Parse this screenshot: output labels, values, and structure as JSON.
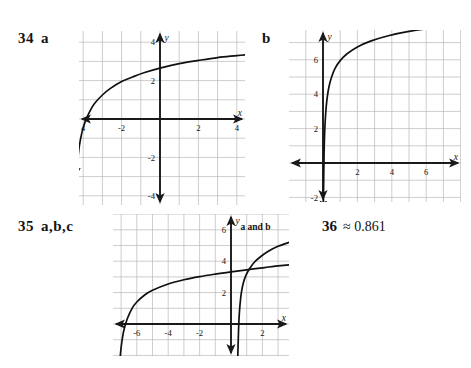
{
  "page": {
    "background": "#ffffff",
    "ink": "#141414",
    "grid_color": "#b9b9b9",
    "axis_color": "#1a1a1a",
    "curve_color": "#101010"
  },
  "items": [
    {
      "id": "item-34",
      "number": "34",
      "parts": "a",
      "label_x": 18,
      "label_y": 30
    },
    {
      "id": "item-34b",
      "number": "",
      "parts": "b",
      "label_x": 262,
      "label_y": 30
    },
    {
      "id": "item-35",
      "number": "35",
      "parts": "a,b,c",
      "label_x": 18,
      "label_y": 218
    }
  ],
  "answer_36": {
    "number": "36",
    "value": "≈ 0.861",
    "x": 322,
    "y": 218
  },
  "chart_data": [
    {
      "id": "graph-34a",
      "type": "line",
      "title": "34 a",
      "xlabel": "x",
      "ylabel": "y",
      "xlim": [
        -5,
        5
      ],
      "ylim": [
        -5,
        5
      ],
      "xticks": [
        -4,
        -2,
        2,
        4
      ],
      "xtick_labels": [
        "4",
        "-2",
        "2",
        "4"
      ],
      "yticks": [
        4,
        2,
        -2,
        -4
      ],
      "ytick_labels": [
        "4",
        "2",
        "-2",
        "-4"
      ],
      "grid": true,
      "legend": "none",
      "series": [
        {
          "name": "a",
          "description": "logarithmic curve, vertical asymptote near x = -4.4",
          "points": [
            [
              -4.35,
              -2.9
            ],
            [
              -4.3,
              -2.3
            ],
            [
              -4.25,
              -1.8
            ],
            [
              -4.2,
              -1.4
            ],
            [
              -4.1,
              -0.85
            ],
            [
              -4.0,
              -0.45
            ],
            [
              -3.9,
              -0.15
            ],
            [
              -3.8,
              0.1
            ],
            [
              -3.6,
              0.5
            ],
            [
              -3.4,
              0.82
            ],
            [
              -3.0,
              1.25
            ],
            [
              -2.6,
              1.58
            ],
            [
              -2.0,
              1.95
            ],
            [
              -1.4,
              2.2
            ],
            [
              -0.8,
              2.42
            ],
            [
              0.0,
              2.65
            ],
            [
              1.0,
              2.88
            ],
            [
              2.0,
              3.05
            ],
            [
              3.0,
              3.2
            ],
            [
              4.0,
              3.3
            ],
            [
              4.8,
              3.38
            ]
          ],
          "arrow_start": true,
          "arrow_end": true
        }
      ]
    },
    {
      "id": "graph-34b",
      "type": "line",
      "title": "b",
      "xlabel": "x",
      "ylabel": "y",
      "xlim": [
        -3,
        9
      ],
      "ylim": [
        -2.8,
        9
      ],
      "xticks": [
        -2,
        2,
        4,
        6,
        8
      ],
      "xtick_labels": [
        "-2",
        "2",
        "4",
        "6",
        "8"
      ],
      "yticks": [
        2,
        4,
        6,
        8,
        -2
      ],
      "ytick_labels": [
        "2",
        "4",
        "6",
        "8",
        "-2"
      ],
      "grid": true,
      "legend": "none",
      "series": [
        {
          "name": "b",
          "description": "logarithmic curve, vertical asymptote at x = 0",
          "points": [
            [
              0.02,
              -2.6
            ],
            [
              0.04,
              -1.0
            ],
            [
              0.06,
              0.4
            ],
            [
              0.08,
              1.3
            ],
            [
              0.12,
              2.3
            ],
            [
              0.18,
              3.2
            ],
            [
              0.25,
              3.85
            ],
            [
              0.35,
              4.45
            ],
            [
              0.5,
              5.0
            ],
            [
              0.7,
              5.5
            ],
            [
              1.0,
              5.95
            ],
            [
              1.4,
              6.35
            ],
            [
              2.0,
              6.75
            ],
            [
              2.8,
              7.1
            ],
            [
              3.8,
              7.4
            ],
            [
              5.0,
              7.65
            ],
            [
              6.4,
              7.85
            ],
            [
              8.0,
              8.0
            ],
            [
              8.9,
              8.05
            ]
          ],
          "arrow_start": true,
          "arrow_end": true
        }
      ]
    },
    {
      "id": "graph-35",
      "type": "line",
      "title": "35 a,b,c",
      "xlabel": "x",
      "ylabel": "y",
      "xlim": [
        -8,
        6
      ],
      "ylim": [
        -2.8,
        7.2
      ],
      "xticks": [
        -6,
        -4,
        -2,
        2,
        4
      ],
      "xtick_labels": [
        "-6",
        "-4",
        "-2",
        "2",
        "4"
      ],
      "yticks": [
        6,
        4,
        2,
        -2
      ],
      "ytick_labels": [
        "6",
        "4",
        "2",
        "-2"
      ],
      "grid": true,
      "legend": "inline",
      "annotations": [
        {
          "text": "a and b",
          "x": 0.6,
          "y": 6.0
        },
        {
          "text": "c",
          "x": 4.0,
          "y": 2.6
        }
      ],
      "series": [
        {
          "name": "a and b",
          "description": "steep logarithmic curve, vertical asymptote near x = 0.35, passes intersection near (1.2, 3.3)",
          "points": [
            [
              0.42,
              -2.6
            ],
            [
              0.45,
              -1.4
            ],
            [
              0.48,
              -0.4
            ],
            [
              0.52,
              0.5
            ],
            [
              0.58,
              1.3
            ],
            [
              0.66,
              2.0
            ],
            [
              0.78,
              2.6
            ],
            [
              0.95,
              3.1
            ],
            [
              1.2,
              3.55
            ],
            [
              1.5,
              3.95
            ],
            [
              1.9,
              4.3
            ],
            [
              2.4,
              4.65
            ],
            [
              3.0,
              4.95
            ],
            [
              3.7,
              5.2
            ],
            [
              4.5,
              5.45
            ],
            [
              5.4,
              5.65
            ],
            [
              5.9,
              5.75
            ]
          ],
          "arrow_start": true,
          "arrow_end": true
        },
        {
          "name": "c",
          "description": "shallow logarithmic curve, vertical asymptote near x = -7.2",
          "points": [
            [
              -7.1,
              -2.6
            ],
            [
              -7.0,
              -1.5
            ],
            [
              -6.9,
              -0.8
            ],
            [
              -6.8,
              -0.3
            ],
            [
              -6.6,
              0.35
            ],
            [
              -6.3,
              1.0
            ],
            [
              -6.0,
              1.4
            ],
            [
              -5.5,
              1.85
            ],
            [
              -5.0,
              2.15
            ],
            [
              -4.0,
              2.55
            ],
            [
              -3.0,
              2.82
            ],
            [
              -2.0,
              3.02
            ],
            [
              -1.0,
              3.18
            ],
            [
              0.0,
              3.32
            ],
            [
              1.0,
              3.45
            ],
            [
              2.0,
              3.58
            ],
            [
              3.0,
              3.7
            ],
            [
              4.2,
              3.82
            ],
            [
              5.4,
              3.92
            ],
            [
              5.9,
              3.96
            ]
          ],
          "arrow_start": false,
          "arrow_end": true
        }
      ]
    }
  ],
  "graph_boxes": {
    "g34a": {
      "left": 79,
      "top": 31,
      "width": 166,
      "height": 174,
      "cell": 19.2,
      "ox": 160,
      "oy": 119
    },
    "g34b": {
      "left": 289,
      "top": 30,
      "width": 172,
      "height": 172,
      "cell": 17.2,
      "ox": 323,
      "oy": 163
    },
    "g35": {
      "left": 113,
      "top": 214,
      "width": 176,
      "height": 142,
      "cell": 15.7,
      "ox": 231,
      "oy": 324
    }
  }
}
